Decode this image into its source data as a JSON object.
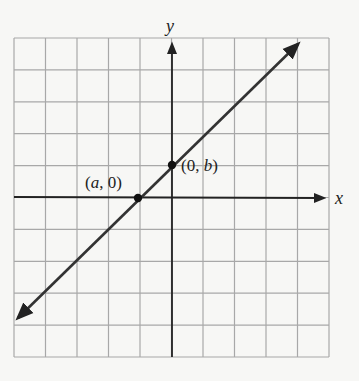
{
  "chart_data": {
    "type": "line",
    "title": "",
    "xlabel": "x",
    "ylabel": "y",
    "grid": true,
    "grid_columns": 10,
    "grid_rows": 10,
    "xlim": [
      -5,
      5
    ],
    "ylim": [
      -5,
      5
    ],
    "series": [
      {
        "name": "line",
        "description": "Straight line with positive slope through x-intercept (a, 0) and y-intercept (0, b), arrows at both ends",
        "x": [
          -4.9,
          4.2
        ],
        "y": [
          -3.8,
          4.9
        ]
      }
    ],
    "points": [
      {
        "label_prefix": "(",
        "var": "a",
        "label_suffix": ", 0)",
        "x": -1.07,
        "y": 0
      },
      {
        "label_prefix": "(0, ",
        "var": "b",
        "label_suffix": ")",
        "x": 0,
        "y": 1.03
      }
    ],
    "colors": {
      "grid": "#a8a8a8",
      "axes": "#222222",
      "line": "#333333",
      "background": "#f7f7f5"
    }
  },
  "labels": {
    "x_axis": "x",
    "y_axis": "y",
    "point_a": "(a, 0)",
    "point_b": "(0, b)"
  }
}
